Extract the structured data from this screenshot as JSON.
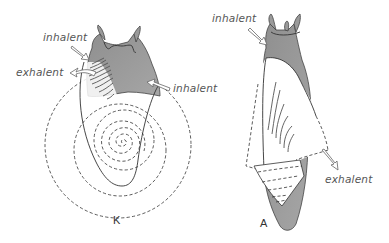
{
  "figure": {
    "panels": [
      {
        "id": "K",
        "caption": "K",
        "labels": {
          "inhalent_left": "inhalent",
          "exhalent": "exhalent",
          "inhalent_right": "inhalent"
        }
      },
      {
        "id": "A",
        "caption": "A",
        "labels": {
          "inhalent": "inhalent",
          "exhalent": "exhalent"
        }
      }
    ],
    "colors": {
      "body": "#9a9a9a",
      "shell_halo": "#f2f2f2",
      "outline": "#333333",
      "label_text": "#555555",
      "background": "#ffffff"
    }
  }
}
